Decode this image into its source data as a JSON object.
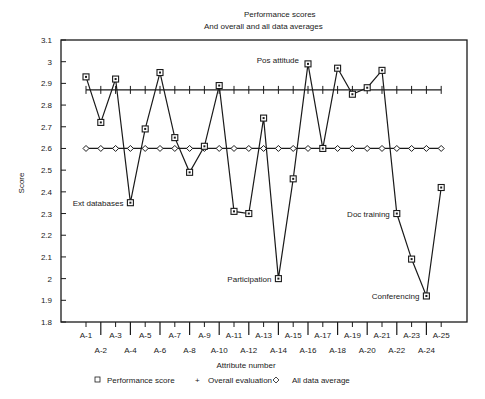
{
  "chart_data": {
    "type": "line",
    "title": "Performance scores",
    "subtitle": "And overall and all data averages",
    "xlabel": "Attribute number",
    "ylabel": "Score",
    "ylim": [
      1.8,
      3.1
    ],
    "yticks": [
      1.8,
      1.9,
      2,
      2.1,
      2.2,
      2.3,
      2.4,
      2.5,
      2.6,
      2.7,
      2.8,
      2.9,
      3,
      3.1
    ],
    "ytick_labels": [
      "1.8",
      "1.9",
      "2",
      "2.1",
      "2.2",
      "2.3",
      "2.4",
      "2.5",
      "2.6",
      "2.7",
      "2.8",
      "2.9",
      "3",
      "3.1"
    ],
    "grid": false,
    "legend_position": "bottom",
    "categories": [
      "A-1",
      "A-2",
      "A-3",
      "A-4",
      "A-5",
      "A-6",
      "A-7",
      "A-8",
      "A-9",
      "A-10",
      "A-11",
      "A-12",
      "A-13",
      "A-14",
      "A-15",
      "A-16",
      "A-17",
      "A-18",
      "A-19",
      "A-20",
      "A-21",
      "A-22",
      "A-23",
      "A-24",
      "A-25"
    ],
    "series": [
      {
        "name": "Performance score",
        "marker": "square",
        "values": [
          2.93,
          2.72,
          2.92,
          2.35,
          2.69,
          2.95,
          2.65,
          2.49,
          2.61,
          2.89,
          2.31,
          2.3,
          2.74,
          2.0,
          2.46,
          2.99,
          2.6,
          2.97,
          2.85,
          2.88,
          2.96,
          2.3,
          2.09,
          1.92,
          2.42
        ]
      },
      {
        "name": "Overall evaluation",
        "marker": "plus",
        "values": [
          2.87,
          2.87,
          2.87,
          2.87,
          2.87,
          2.87,
          2.87,
          2.87,
          2.87,
          2.87,
          2.87,
          2.87,
          2.87,
          2.87,
          2.87,
          2.87,
          2.87,
          2.87,
          2.87,
          2.87,
          2.87,
          2.87,
          2.87,
          2.87,
          2.87
        ]
      },
      {
        "name": "All data average",
        "marker": "diamond",
        "values": [
          2.6,
          2.6,
          2.6,
          2.6,
          2.6,
          2.6,
          2.6,
          2.6,
          2.6,
          2.6,
          2.6,
          2.6,
          2.6,
          2.6,
          2.6,
          2.6,
          2.6,
          2.6,
          2.6,
          2.6,
          2.6,
          2.6,
          2.6,
          2.6,
          2.6
        ]
      }
    ],
    "annotations": [
      {
        "text": "Ext databases",
        "category": "A-4",
        "side": "left"
      },
      {
        "text": "Pos attitude",
        "category": "A-16",
        "side": "left"
      },
      {
        "text": "Participation",
        "category": "A-14",
        "side": "left"
      },
      {
        "text": "Doc training",
        "category": "A-22",
        "side": "left"
      },
      {
        "text": "Conferencing",
        "category": "A-24",
        "side": "left"
      }
    ],
    "legend": [
      {
        "symbol": "□",
        "label": "Performance score"
      },
      {
        "symbol": "+",
        "label": "Overall evaluation"
      },
      {
        "symbol": "◇",
        "label": "All data average"
      }
    ]
  },
  "colors": {
    "ink": "#1a1a1a",
    "background": "#ffffff"
  }
}
